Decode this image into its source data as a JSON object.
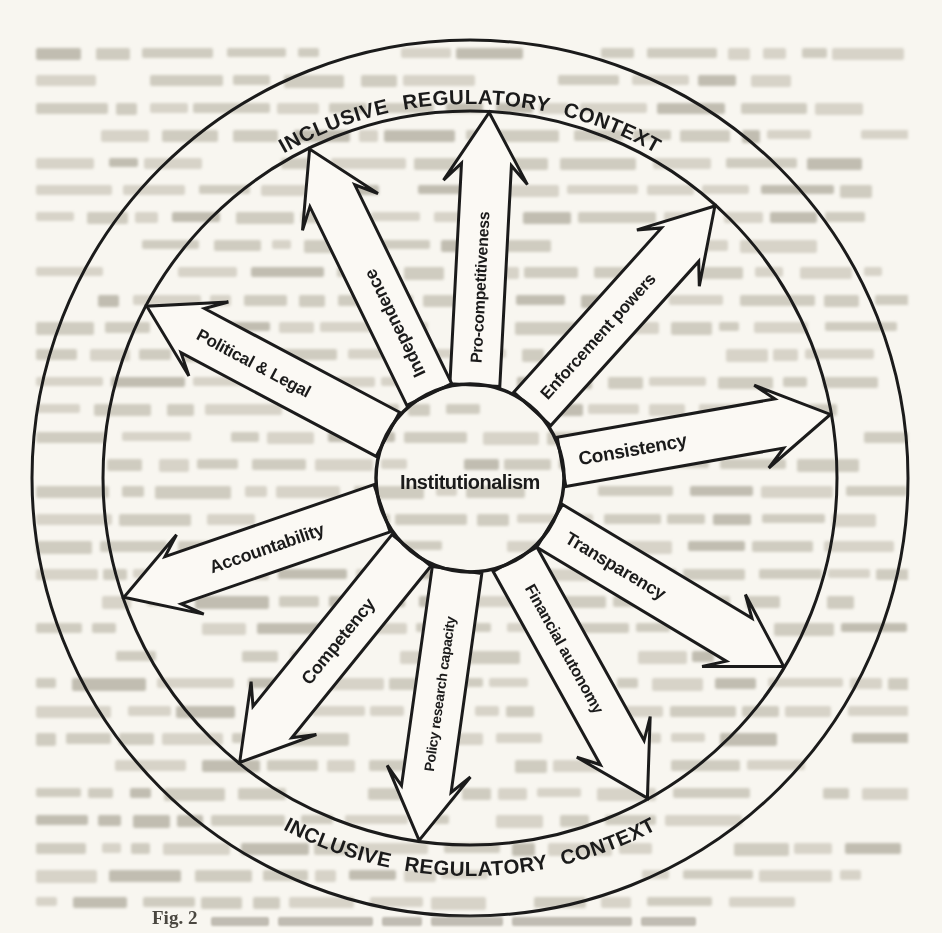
{
  "figure": {
    "type": "radial-arrow-diagram",
    "center_label": "Institutionalism",
    "ring_text_top": "INCLUSIVE  REGULATORY  CONTEXT",
    "ring_text_bottom": "INCLUSIVE  REGULATORY  CONTEXT",
    "caption_prefix": "Fig. 2",
    "colors": {
      "ink": "#1b1b1b",
      "page": "#f8f6f0",
      "arrow_fill": "#fbf9f4"
    },
    "spokes": [
      {
        "label": "Consistency",
        "angle_deg": 10,
        "label_reads": "outward"
      },
      {
        "label": "Enforcement powers",
        "angle_deg": 48,
        "label_reads": "outward"
      },
      {
        "label": "Pro-competitiveness",
        "angle_deg": 87,
        "label_reads": "outward"
      },
      {
        "label": "Independence",
        "angle_deg": 116,
        "label_reads": "outward"
      },
      {
        "label": "Political & Legal",
        "angle_deg": 152,
        "label_reads": "inward"
      },
      {
        "label": "Accountability",
        "angle_deg": 199,
        "label_reads": "inward"
      },
      {
        "label": "Competency",
        "angle_deg": 231,
        "label_reads": "inward"
      },
      {
        "label": "Policy research capacity",
        "angle_deg": 262,
        "label_reads": "inward"
      },
      {
        "label": "Financial autonomy",
        "angle_deg": 299,
        "label_reads": "outward"
      },
      {
        "label": "Transparency",
        "angle_deg": 329,
        "label_reads": "outward"
      }
    ]
  }
}
